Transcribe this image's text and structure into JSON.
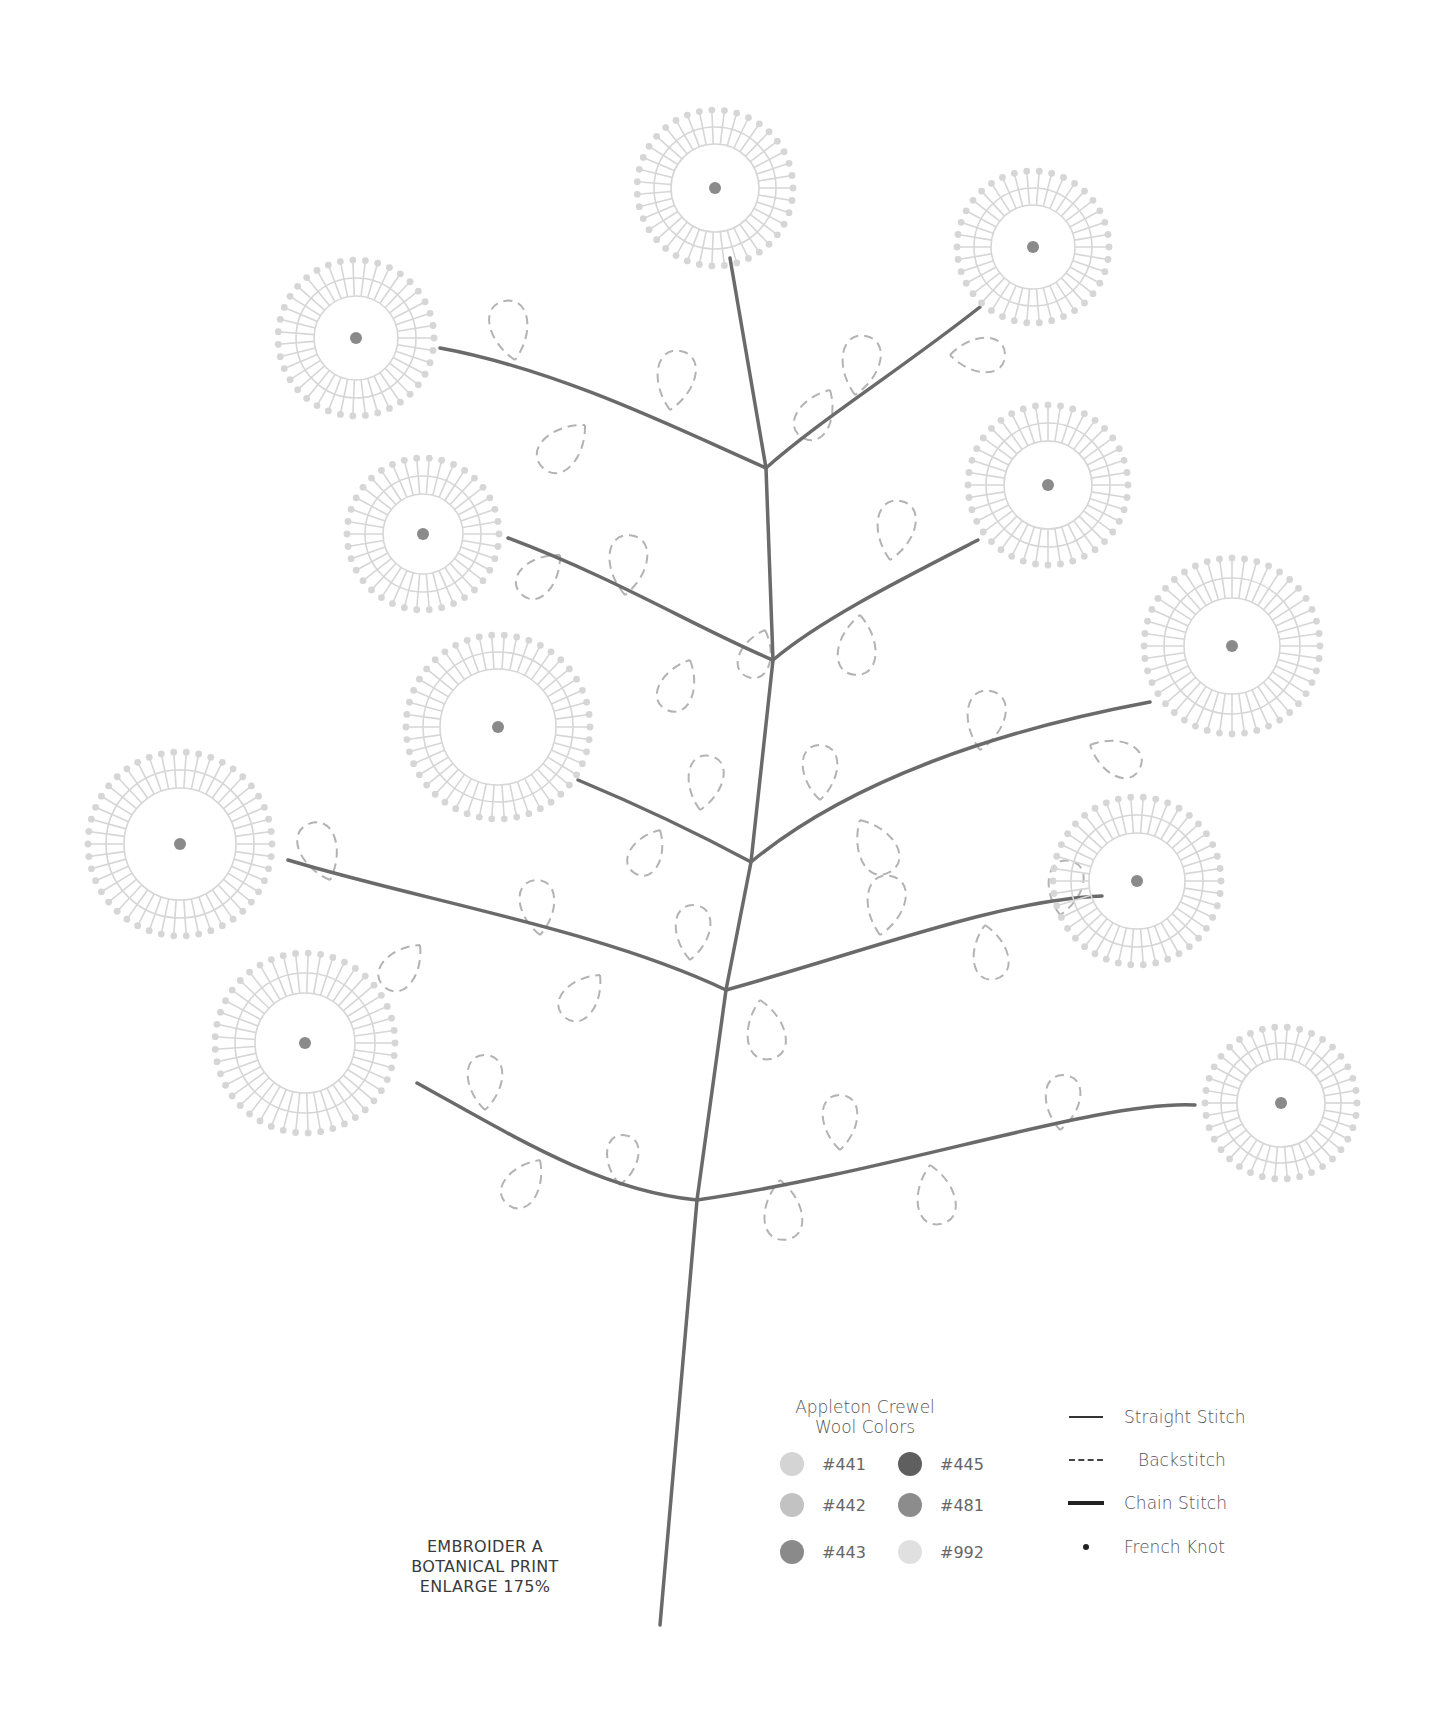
{
  "caption": {
    "line1": "EMBROIDER A",
    "line2": "BOTANICAL PRINT",
    "line3": "ENLARGE 175%"
  },
  "legend": {
    "colors_title_line1": "Appleton Crewel",
    "colors_title_line2": "Wool Colors",
    "colors": [
      {
        "code": "#441",
        "hex": "#d4d4d4"
      },
      {
        "code": "#445",
        "hex": "#5f5f5f"
      },
      {
        "code": "#442",
        "hex": "#c2c2c2"
      },
      {
        "code": "#481",
        "hex": "#8c8c8c"
      },
      {
        "code": "#443",
        "hex": "#8a8a8a"
      },
      {
        "code": "#992",
        "hex": "#e0e0e0"
      }
    ],
    "stitches": [
      {
        "label": "Straight Stitch",
        "type": "straight"
      },
      {
        "label": "Backstitch",
        "type": "back"
      },
      {
        "label": "Chain Stitch",
        "type": "chain"
      },
      {
        "label": "French Knot",
        "type": "knot"
      }
    ]
  },
  "palette": {
    "stem": "#6a6a6a",
    "leaf": "#b0b0b0",
    "flower": "#d6d6d6",
    "center": "#8a8a8a"
  }
}
